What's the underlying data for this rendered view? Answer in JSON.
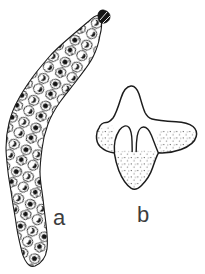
{
  "page": {
    "background_color": "#ffffff",
    "ink_color": "#1c1c1c",
    "label_color": "#3d3d3d"
  },
  "figure": {
    "panel_a_label": "a",
    "panel_b_label": "b"
  }
}
